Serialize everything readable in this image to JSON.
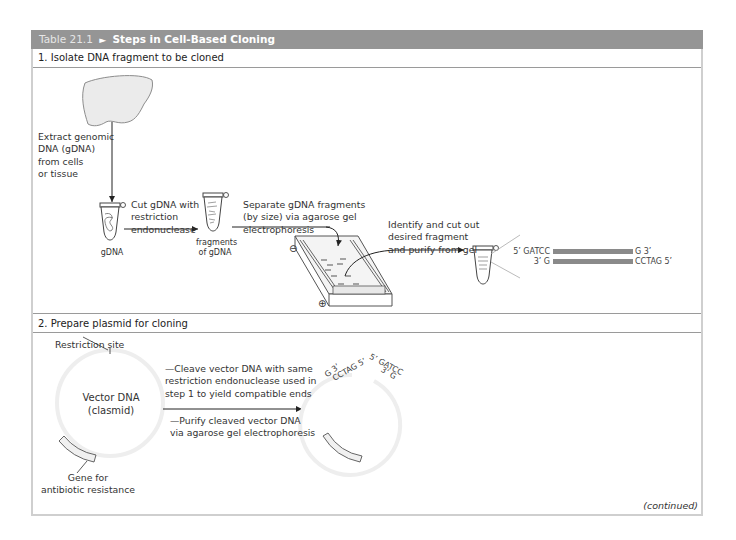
{
  "table": {
    "number": "Table 21.1",
    "marker": "►",
    "title": "Steps in Cell-Based Cloning",
    "footer": "(continued)"
  },
  "step1": {
    "heading": "1. Isolate DNA fragment to be cloned",
    "extract_label": [
      "Extract genomic",
      "DNA (gDNA)",
      "from cells",
      "or tissue"
    ],
    "cut_label": [
      "Cut gDNA with",
      "restriction",
      "endonuclease"
    ],
    "tube1_label": "gDNA",
    "tube2_label": [
      "fragments",
      "of gDNA"
    ],
    "separate_label": [
      "Separate gDNA fragments",
      "(by size) via agarose gel",
      "electrophoresis"
    ],
    "identify_label": [
      "Identify and cut out",
      "desired fragment",
      "and purify from gel"
    ],
    "gel_minus": "⊖",
    "gel_plus": "⊕",
    "fragment": {
      "top_left": "5’ GATCC",
      "top_right": "G 3’",
      "bottom_left": "3’ G",
      "bottom_right": "CCTAG 5’",
      "bar_color": "#8a8a8a"
    }
  },
  "step2": {
    "heading": "2. Prepare plasmid for cloning",
    "restriction_site_label": "Restriction site",
    "vector_label": [
      "Vector DNA",
      "(clasmid)"
    ],
    "gene_label": [
      "Gene for",
      "antibiotic resistance"
    ],
    "cleave_label": [
      "—Cleave vector DNA with same",
      "restriction endonuclease used in",
      "step 1 to yield compatible ends"
    ],
    "purify_label": [
      "—Purify cleaved vector DNA",
      "via agarose gel electrophoresis"
    ],
    "cut_plasmid_ends": {
      "left_outer": "G 3’",
      "left_inner": "CCTAG 5’",
      "right_outer": "5’ GATCC",
      "right_inner": "3’ G"
    }
  },
  "colors": {
    "title_bar": "#959595",
    "frame": "#cfcfcf",
    "liver_fill": "#ebebeb",
    "plasmid_ring": "#f0f0f0"
  }
}
